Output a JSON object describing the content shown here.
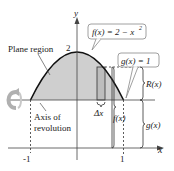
{
  "diagram": {
    "axes": {
      "x_label": "x",
      "y_label": "y",
      "x_ticks": [
        "-1",
        "1"
      ],
      "y_tick": "2"
    },
    "labels": {
      "plane_region": "Plane region",
      "axis_line1": "Axis of",
      "axis_line2": "revolution",
      "f_callout": "f(x) = 2 − x",
      "f_callout_exp": "2",
      "g_callout": "g(x) = 1",
      "delta_x": "Δx",
      "f_brace": "f(x)",
      "R_brace": "R(x)",
      "g_brace": "g(x)"
    },
    "functions": {
      "f": "2 - x^2",
      "g": "1"
    },
    "colors": {
      "region_fill": "#cfcfcf",
      "curve": "#111111",
      "axis": "#444444",
      "callout_border": "#888888",
      "rotation_arrow": "#b0b0b0"
    }
  }
}
